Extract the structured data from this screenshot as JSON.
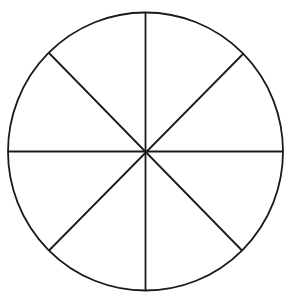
{
  "diagram": {
    "type": "circle-divided-into-equal-sectors",
    "sectors": 8,
    "center": [
      145.5,
      151.5
    ],
    "radius_x": 137.5,
    "radius_y": 139,
    "stroke_color": "#1a1a1a",
    "stroke_width": 1.8,
    "background_color": "#ffffff",
    "dividing_lines": [
      {
        "name": "vertical",
        "x1": 145.5,
        "y1": 12.5,
        "x2": 145.5,
        "y2": 290.5
      },
      {
        "name": "horizontal",
        "x1": 8,
        "y1": 151.5,
        "x2": 283,
        "y2": 151.5
      },
      {
        "name": "diagonal-down",
        "x1": 49,
        "y1": 53,
        "x2": 242,
        "y2": 250.5
      },
      {
        "name": "diagonal-up",
        "x1": 49,
        "y1": 250.5,
        "x2": 243,
        "y2": 54
      }
    ]
  }
}
